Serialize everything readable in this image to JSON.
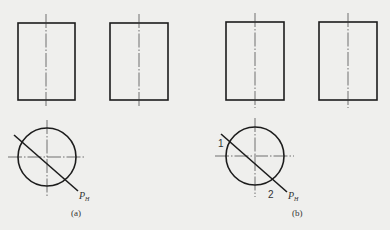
{
  "figure": {
    "panels": [
      {
        "id": "a",
        "caption": "(a)",
        "plane_label": "P",
        "plane_subscript": "H",
        "point_labels": []
      },
      {
        "id": "b",
        "caption": "(b)",
        "plane_label": "P",
        "plane_subscript": "H",
        "point_labels": [
          "1",
          "2"
        ]
      }
    ],
    "colors": {
      "background": "#efefed",
      "line": "#1c1c1c"
    }
  }
}
